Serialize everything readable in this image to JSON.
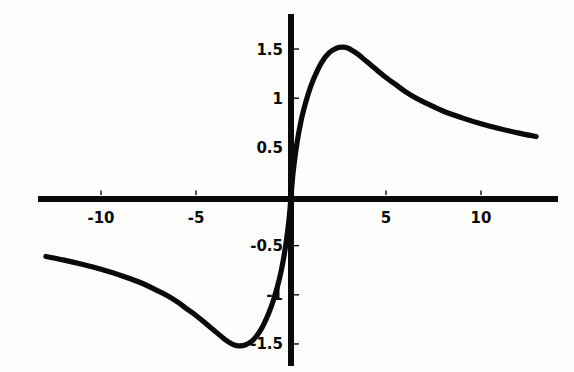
{
  "figure": {
    "title": "",
    "background_color": "#fdfdfb",
    "ink_color": "#0a0a0a",
    "width_px": 574,
    "height_px": 372
  },
  "axes": {
    "x_axis_name": "x-axis",
    "y_axis_name": "y-axis",
    "x_tick_labels": [
      "-10",
      "-5",
      "5",
      "10"
    ],
    "y_tick_labels": [
      "1.5",
      "1",
      "0.5",
      "-0.5",
      "-1",
      "-1.5"
    ]
  },
  "chart_data": {
    "type": "line",
    "title": "",
    "subtitle": "",
    "xlabel": "",
    "ylabel": "",
    "xlim": [
      -13.0,
      13.0
    ],
    "ylim": [
      -1.6,
      1.6
    ],
    "xticks": [
      -10,
      -5,
      5,
      10
    ],
    "yticks": [
      1.5,
      1,
      0.5,
      -0.5,
      -1,
      -1.5
    ],
    "xtick_labels": [
      "-10",
      "-5",
      "5",
      "10"
    ],
    "ytick_labels": [
      "1.5",
      "1",
      "0.5",
      "-0.5",
      "-1",
      "-1.5"
    ],
    "grid": false,
    "legend": null,
    "legend_position": "none",
    "annotations": [],
    "axis_style": "centered-spines",
    "series": [
      {
        "name": "curve",
        "color": "#0a0a0a",
        "line_width": 5.2,
        "x": [
          -12.9,
          -12.0,
          -11.0,
          -10.0,
          -9.0,
          -8.0,
          -7.0,
          -6.5,
          -6.0,
          -5.5,
          -5.0,
          -4.5,
          -4.0,
          -3.5,
          -3.0,
          -2.7,
          -2.4,
          -2.0,
          -1.6,
          -1.2,
          -0.9,
          -0.6,
          -0.4,
          -0.25,
          -0.12,
          -0.05,
          0.0,
          0.05,
          0.12,
          0.25,
          0.4,
          0.6,
          0.9,
          1.2,
          1.6,
          2.0,
          2.4,
          2.7,
          3.0,
          3.5,
          4.0,
          4.5,
          5.0,
          5.5,
          6.0,
          6.5,
          7.0,
          8.0,
          9.0,
          10.0,
          11.0,
          12.0,
          12.9
        ],
        "y": [
          -0.61,
          -0.645,
          -0.69,
          -0.74,
          -0.8,
          -0.87,
          -0.96,
          -1.01,
          -1.07,
          -1.14,
          -1.21,
          -1.29,
          -1.37,
          -1.45,
          -1.51,
          -1.52,
          -1.51,
          -1.46,
          -1.36,
          -1.2,
          -1.04,
          -0.83,
          -0.64,
          -0.46,
          -0.26,
          -0.12,
          0.0,
          0.12,
          0.26,
          0.46,
          0.64,
          0.83,
          1.04,
          1.2,
          1.36,
          1.46,
          1.51,
          1.52,
          1.51,
          1.45,
          1.37,
          1.29,
          1.21,
          1.14,
          1.07,
          1.01,
          0.96,
          0.87,
          0.8,
          0.74,
          0.69,
          0.645,
          0.61
        ],
        "features": {
          "maximum": {
            "x": 2.7,
            "y": 1.52
          },
          "minimum": {
            "x": -2.7,
            "y": -1.52
          },
          "zero_crossing": {
            "x": 0.0,
            "y": 0.0
          },
          "left_endpoint": {
            "x": -12.9,
            "y": -0.61
          },
          "right_endpoint": {
            "x": 12.9,
            "y": 0.61
          },
          "symmetry": "odd"
        }
      }
    ]
  }
}
